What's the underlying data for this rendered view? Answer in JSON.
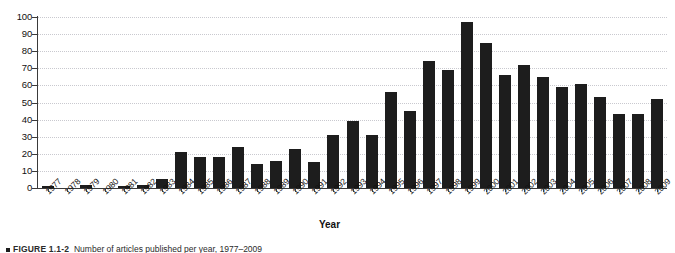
{
  "figure": {
    "caption_marker": "square-bullet",
    "caption_number": "FIGURE 1.1-2",
    "caption_text": "Number of articles published per year, 1977–2009"
  },
  "axes": {
    "x_title": "Year",
    "y_title": "",
    "y_ticks": [
      0,
      10,
      20,
      30,
      40,
      50,
      60,
      70,
      80,
      90,
      100
    ],
    "y_min": 0,
    "y_max": 100,
    "grid": "horizontal-dotted"
  },
  "colors": {
    "bar": "#1d1d1d",
    "grid": "#c9c9cf",
    "axis": "#3a3a3a",
    "background": "#ffffff",
    "text": "#111111"
  },
  "chart_data": {
    "type": "bar",
    "title": "",
    "xlabel": "Year",
    "ylabel": "",
    "ylim": [
      0,
      100
    ],
    "grid": true,
    "legend": "none",
    "categories": [
      "1977",
      "1978",
      "1979",
      "1980",
      "1981",
      "1982",
      "1983",
      "1984",
      "1985",
      "1986",
      "1987",
      "1988",
      "1989",
      "1990",
      "1991",
      "1992",
      "1993",
      "1994",
      "1995",
      "1996",
      "1997",
      "1998",
      "1999",
      "2000",
      "2001",
      "2002",
      "2003",
      "2004",
      "2005",
      "2006",
      "2007",
      "2008",
      "2009"
    ],
    "values": [
      1,
      0,
      2,
      0,
      1,
      2,
      5,
      21,
      18,
      18,
      24,
      14,
      16,
      23,
      15,
      31,
      39,
      31,
      56,
      45,
      74,
      69,
      97,
      85,
      66,
      72,
      65,
      59,
      61,
      53,
      43,
      43,
      52
    ]
  }
}
